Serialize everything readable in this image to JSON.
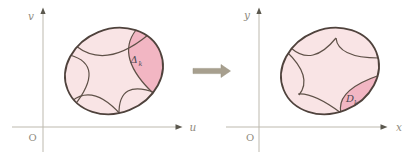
{
  "colors": {
    "ellipse-fill": "#f9e4e5",
    "highlight-fill": "#f2b6c3",
    "ellipse-stroke": "#4f423c",
    "arc-stroke": "#5f5148",
    "axis-line": "#bdb9ae",
    "axis-arrow": "#5b584e",
    "axis-label": "#8f8b80",
    "region-label": "#4b4650",
    "map-arrow": "#a79f8e",
    "map-arrow-edge": "#96907e"
  },
  "left_panel": {
    "vertical_axis_label": "v",
    "horizontal_axis_label": "u",
    "origin_label": "O",
    "region_label": "Δ",
    "region_label_sub": "k"
  },
  "right_panel": {
    "vertical_axis_label": "y",
    "horizontal_axis_label": "x",
    "origin_label": "O",
    "region_label": "D",
    "region_label_sub": "k"
  }
}
